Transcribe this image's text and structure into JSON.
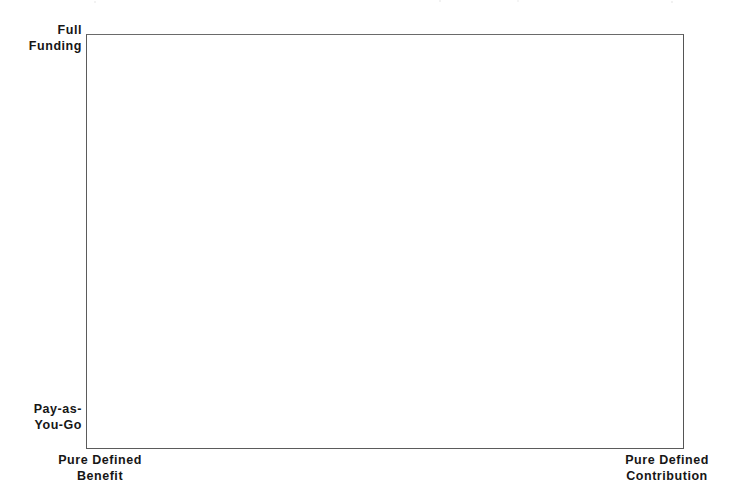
{
  "figure": {
    "background_color": "#ffffff",
    "line_color": "#5b5b5b",
    "text_color": "#161616"
  },
  "chart_data": {
    "type": "scatter",
    "title": "",
    "subtitle": "",
    "xlabel": "",
    "ylabel": "",
    "grid": false,
    "legend": null,
    "series": [],
    "x": [],
    "values": [],
    "annotations": [],
    "note": "Empty conceptual framework plot area - no data points, curves, gridlines or tick marks are drawn inside the box.",
    "axes": {
      "x": {
        "kind": "categorical-continuum",
        "left_anchor": "Pure Defined Benefit",
        "right_anchor": "Pure Defined Contribution",
        "ticks": [],
        "ticklabels": []
      },
      "y": {
        "kind": "categorical-continuum",
        "bottom_anchor": "Pay-as-You-Go",
        "top_anchor": "Full Funding",
        "ticks": [],
        "ticklabels": []
      }
    }
  },
  "labels": {
    "y_top": {
      "name": "Full Funding",
      "lines": [
        "Full",
        "Funding"
      ]
    },
    "y_bottom": {
      "name": "Pay-as-You-Go",
      "lines": [
        "Pay-as-",
        "You-Go"
      ]
    },
    "x_left": {
      "name": "Pure Defined Benefit",
      "lines": [
        "Pure Defined",
        "Benefit"
      ]
    },
    "x_right": {
      "name": "Pure Defined Contribution",
      "lines": [
        "Pure Defined",
        "Contribution"
      ]
    }
  }
}
